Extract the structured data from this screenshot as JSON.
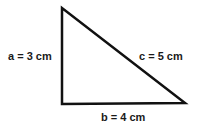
{
  "diagram": {
    "type": "right-triangle",
    "sides": {
      "a": {
        "label": "a = 3 cm"
      },
      "b": {
        "label": "b = 4 cm"
      },
      "c": {
        "label": "c = 5 cm"
      }
    },
    "stroke_color": "#111111"
  }
}
